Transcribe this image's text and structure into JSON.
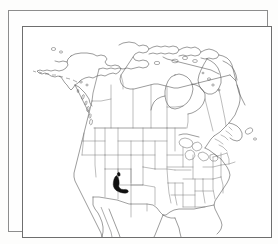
{
  "figure": {
    "type": "map",
    "description": "Outline map of North America showing Canada, the United States and northern Mexico with internal state and province boundaries. A single small area in the southwestern United States is shaded solid black.",
    "frame": {
      "style": "double-line rectangle",
      "outer_color": "#8d8d8d",
      "inner_color": "#6e6e6e",
      "background_color": "#ffffff"
    },
    "linework": {
      "coastline_color": "#4a4a4a",
      "international_border_color": "#555555",
      "subdivision_border_color": "#6b6b6b",
      "highlight_fill_color": "#111111"
    },
    "extent": {
      "region": "North America",
      "north_feature": "Baffin Island and Canadian Arctic Archipelago",
      "west_feature": "Alaska and the Aleutian Islands",
      "east_feature": "Newfoundland and the Atlantic coast",
      "south_feature": "Northern Mexico, clipped at frame edge"
    },
    "highlight": {
      "label": "shaded distribution area",
      "location": "southern Arizona and southwestern New Mexico, United States",
      "fill": "solid black",
      "count": 1
    },
    "features": [
      {
        "name": "Alaska",
        "kind": "state-outline"
      },
      {
        "name": "Aleutian Islands",
        "kind": "island-chain"
      },
      {
        "name": "Canada",
        "kind": "country"
      },
      {
        "name": "Baffin Island",
        "kind": "island"
      },
      {
        "name": "Hudson Bay",
        "kind": "bay"
      },
      {
        "name": "Great Lakes",
        "kind": "lakes"
      },
      {
        "name": "Newfoundland",
        "kind": "island"
      },
      {
        "name": "United States",
        "kind": "country"
      },
      {
        "name": "Mexico",
        "kind": "country"
      },
      {
        "name": "Baja California",
        "kind": "peninsula"
      },
      {
        "name": "Florida",
        "kind": "peninsula"
      }
    ]
  }
}
